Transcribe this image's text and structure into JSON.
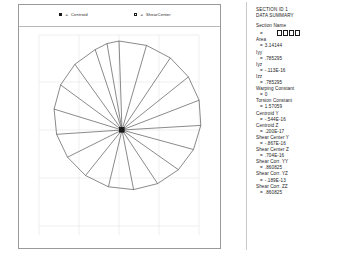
{
  "legend": {
    "centroid": {
      "marker": "filled-square-marker",
      "eq": "=",
      "label": "Centroid"
    },
    "shear": {
      "marker": "open-square-marker",
      "eq": "=",
      "label": "ShearCenter"
    }
  },
  "plot": {
    "shape": "circle-section-mesh",
    "segments": 20,
    "center_marker": "centroid-marker",
    "axis": {
      "x_ticks": [
        "-1",
        "-.5",
        "0",
        ".5",
        "1"
      ],
      "y_ticks": [
        "1",
        ".5",
        "0",
        "-.5",
        "-1"
      ]
    }
  },
  "data_panel": {
    "title_line1": "SECTION ID 1",
    "title_line2": "DATA SUMMARY",
    "properties": [
      {
        "label": "Section Name",
        "eq": "=",
        "value": "",
        "is_box": true
      },
      {
        "label": "Area",
        "eq": "=",
        "value": "3.14144"
      },
      {
        "label": "Iyy",
        "eq": "=",
        "value": ".785295"
      },
      {
        "label": "Iyz",
        "eq": "=",
        "value": "-.113E-16"
      },
      {
        "label": "Izz",
        "eq": "=",
        "value": ".785295"
      },
      {
        "label": "Warping Constant",
        "eq": "=",
        "value": "0"
      },
      {
        "label": "Torsion Constant",
        "eq": "=",
        "value": "1.57059"
      },
      {
        "label": "Centroid Y",
        "eq": "=",
        "value": "-.544E-16"
      },
      {
        "label": "Centroid Z",
        "eq": "=",
        "value": ".200E-17"
      },
      {
        "label": "Shear Center Y",
        "eq": "=",
        "value": "-.867E-16"
      },
      {
        "label": "Shear Center Z",
        "eq": "=",
        "value": ".704E-16"
      },
      {
        "label": "Shear Corr. YY",
        "eq": "=",
        "value": ".860825"
      },
      {
        "label": "Shear Corr. YZ",
        "eq": "=",
        "value": "-.189E-13"
      },
      {
        "label": "Shear Corr. ZZ",
        "eq": "=",
        "value": ".860825"
      }
    ]
  },
  "colors": {
    "frame": "#9a9a9a",
    "mesh_line": "#4a4a4a",
    "grid": "#d8d8d8",
    "text": "#1b1b1b"
  }
}
